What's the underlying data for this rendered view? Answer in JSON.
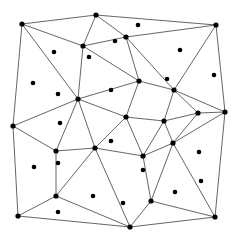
{
  "diagram": {
    "type": "triangulation-with-sites",
    "canvas": {
      "width": 236,
      "height": 239,
      "background": "#ffffff"
    },
    "colors": {
      "edge": "#555555",
      "vertex": "#000000",
      "site": "#000000"
    },
    "vertices": [
      {
        "id": "A",
        "x": 22,
        "y": 24
      },
      {
        "id": "B",
        "x": 96,
        "y": 15
      },
      {
        "id": "C",
        "x": 216,
        "y": 25
      },
      {
        "id": "D",
        "x": 83,
        "y": 46
      },
      {
        "id": "E",
        "x": 126,
        "y": 37
      },
      {
        "id": "F",
        "x": 13,
        "y": 126
      },
      {
        "id": "G",
        "x": 78,
        "y": 99
      },
      {
        "id": "H",
        "x": 139,
        "y": 81
      },
      {
        "id": "I",
        "x": 174,
        "y": 90
      },
      {
        "id": "J",
        "x": 225,
        "y": 112
      },
      {
        "id": "K",
        "x": 198,
        "y": 113
      },
      {
        "id": "L",
        "x": 126,
        "y": 117
      },
      {
        "id": "M",
        "x": 164,
        "y": 121
      },
      {
        "id": "N",
        "x": 56,
        "y": 151
      },
      {
        "id": "O",
        "x": 95,
        "y": 148
      },
      {
        "id": "P",
        "x": 173,
        "y": 143
      },
      {
        "id": "Q",
        "x": 143,
        "y": 156
      },
      {
        "id": "R",
        "x": 56,
        "y": 196
      },
      {
        "id": "S",
        "x": 151,
        "y": 201
      },
      {
        "id": "T",
        "x": 18,
        "y": 216
      },
      {
        "id": "U",
        "x": 130,
        "y": 227
      },
      {
        "id": "V",
        "x": 215,
        "y": 217
      }
    ],
    "edges": [
      [
        "A",
        "B"
      ],
      [
        "B",
        "C"
      ],
      [
        "A",
        "D"
      ],
      [
        "B",
        "D"
      ],
      [
        "B",
        "E"
      ],
      [
        "D",
        "E"
      ],
      [
        "E",
        "C"
      ],
      [
        "A",
        "F"
      ],
      [
        "A",
        "G"
      ],
      [
        "D",
        "G"
      ],
      [
        "D",
        "H"
      ],
      [
        "E",
        "H"
      ],
      [
        "E",
        "I"
      ],
      [
        "C",
        "I"
      ],
      [
        "C",
        "J"
      ],
      [
        "H",
        "I"
      ],
      [
        "I",
        "K"
      ],
      [
        "I",
        "J"
      ],
      [
        "K",
        "J"
      ],
      [
        "I",
        "M"
      ],
      [
        "M",
        "K"
      ],
      [
        "F",
        "G"
      ],
      [
        "G",
        "H"
      ],
      [
        "G",
        "L"
      ],
      [
        "H",
        "L"
      ],
      [
        "L",
        "M"
      ],
      [
        "G",
        "N"
      ],
      [
        "G",
        "O"
      ],
      [
        "F",
        "N"
      ],
      [
        "L",
        "O"
      ],
      [
        "L",
        "Q"
      ],
      [
        "M",
        "Q"
      ],
      [
        "M",
        "P"
      ],
      [
        "K",
        "P"
      ],
      [
        "J",
        "P"
      ],
      [
        "J",
        "V"
      ],
      [
        "N",
        "O"
      ],
      [
        "O",
        "Q"
      ],
      [
        "Q",
        "S"
      ],
      [
        "P",
        "S"
      ],
      [
        "P",
        "V"
      ],
      [
        "Q",
        "P"
      ],
      [
        "F",
        "T"
      ],
      [
        "N",
        "R"
      ],
      [
        "R",
        "T"
      ],
      [
        "O",
        "R"
      ],
      [
        "O",
        "U"
      ],
      [
        "R",
        "U"
      ],
      [
        "T",
        "U"
      ],
      [
        "S",
        "U"
      ],
      [
        "S",
        "V"
      ],
      [
        "U",
        "V"
      ]
    ],
    "sites": [
      {
        "x": 54,
        "y": 52
      },
      {
        "x": 89,
        "y": 57
      },
      {
        "x": 115,
        "y": 41
      },
      {
        "x": 138,
        "y": 25
      },
      {
        "x": 180,
        "y": 50
      },
      {
        "x": 214,
        "y": 75
      },
      {
        "x": 167,
        "y": 79
      },
      {
        "x": 111,
        "y": 90
      },
      {
        "x": 33,
        "y": 83
      },
      {
        "x": 58,
        "y": 94
      },
      {
        "x": 60,
        "y": 123
      },
      {
        "x": 111,
        "y": 141
      },
      {
        "x": 143,
        "y": 170
      },
      {
        "x": 199,
        "y": 152
      },
      {
        "x": 201,
        "y": 181
      },
      {
        "x": 175,
        "y": 192
      },
      {
        "x": 123,
        "y": 203
      },
      {
        "x": 93,
        "y": 196
      },
      {
        "x": 58,
        "y": 212
      },
      {
        "x": 58,
        "y": 163
      },
      {
        "x": 34,
        "y": 167
      }
    ],
    "vertex_radius": 2.6,
    "site_radius": 2.3
  }
}
